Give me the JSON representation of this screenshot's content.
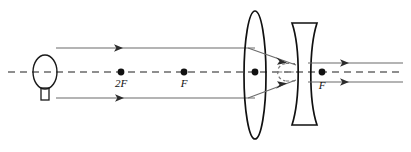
{
  "figure": {
    "type": "optics-ray-diagram",
    "width": 411,
    "height": 152,
    "background_color": "#ffffff",
    "line_color": "#1a1a1a",
    "ray_color": "#555555",
    "dash_color": "#555555"
  },
  "labels": {
    "two_f_left": "2F",
    "f_left": "F",
    "f_right": "F"
  },
  "optical_axis": {
    "y": 72,
    "x_start": 8,
    "x_end": 403,
    "style": "dashed"
  },
  "source": {
    "name": "light-bulb",
    "center_x": 45,
    "center_y": 72,
    "rx": 12,
    "ry": 17,
    "base_x": 41,
    "base_y": 89,
    "base_w": 8,
    "base_h": 11
  },
  "points": [
    {
      "name": "point-2F-left",
      "x": 121,
      "y": 72,
      "label": "2F",
      "label_y": 86
    },
    {
      "name": "point-F-left",
      "x": 184,
      "y": 72,
      "label": "F",
      "label_y": 86
    },
    {
      "name": "point-lens-center",
      "x": 255,
      "y": 72,
      "label": "",
      "label_y": 0
    },
    {
      "name": "point-F-right",
      "x": 322,
      "y": 72,
      "label": "F",
      "label_y": 86
    }
  ],
  "converging_lens": {
    "name": "converging-lens",
    "center_x": 255,
    "center_y": 75,
    "rx": 11,
    "ry": 64
  },
  "diverging_lens": {
    "name": "diverging-lens",
    "left_x": 292,
    "right_x": 317,
    "top_y": 23,
    "bottom_y": 125,
    "waist_offset": 7
  },
  "incoming_rays": [
    {
      "name": "incoming-ray-top",
      "y": 48,
      "x_start": 56,
      "x_end": 255,
      "arrow_x": 122
    },
    {
      "name": "incoming-ray-bottom",
      "y": 98,
      "x_start": 56,
      "x_end": 255,
      "arrow_x": 123
    }
  ],
  "converging_rays": [
    {
      "name": "converging-ray-top",
      "x1": 255,
      "y1": 48,
      "x2": 291,
      "y2": 66,
      "arrow_x": 285,
      "arrow_y": 63
    },
    {
      "name": "converging-ray-bottom",
      "x1": 255,
      "y1": 98,
      "x2": 291,
      "y2": 79,
      "arrow_x": 285,
      "arrow_y": 82
    }
  ],
  "outgoing_rays": [
    {
      "name": "outgoing-ray-top",
      "y": 63,
      "x_start": 317,
      "x_end": 403,
      "arrow_x": 348
    },
    {
      "name": "outgoing-ray-bottom",
      "y": 82,
      "x_start": 317,
      "x_end": 403,
      "arrow_x": 348
    }
  ],
  "virtual_construction": {
    "name": "virtual-image-construction",
    "left_x": 279,
    "right_x": 300,
    "top_y": 64,
    "bottom_y": 81,
    "style": "dashed"
  }
}
